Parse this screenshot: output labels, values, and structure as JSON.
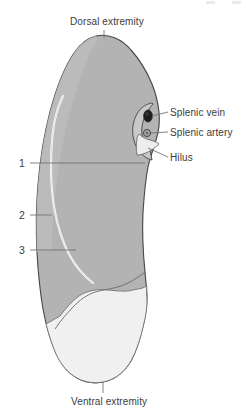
{
  "figure": {
    "background_color": "#ffffff"
  },
  "labels": {
    "dorsal_extremity": "Dorsal extremity",
    "ventral_extremity": "Ventral extremity",
    "splenic_vein": "Splenic vein",
    "splenic_artery": "Splenic artery",
    "hilus": "Hilus"
  },
  "numbered_callouts": [
    {
      "number": "1",
      "leader_length": "long"
    },
    {
      "number": "2",
      "leader_length": "short"
    },
    {
      "number": "3",
      "leader_length": "medium"
    }
  ],
  "colors": {
    "organ_body": "#b3b3b3",
    "organ_body_light": "#c4c4c4",
    "ventral_pale_region": "#f0f0f0",
    "outline": "#4a4a4a",
    "ridge_line": "#fbfbfb",
    "vein_fill": "#1d1d1d",
    "artery_fill": "#9a9a9a",
    "leader_line": "#6d6d6d",
    "text": "#3c3c3c"
  }
}
